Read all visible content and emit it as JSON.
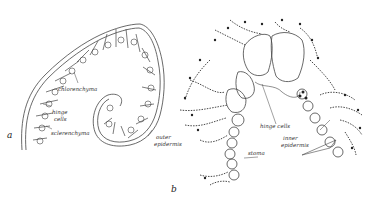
{
  "figure": {
    "panels": [
      {
        "id": "a",
        "letter": "a",
        "labels": {
          "chlorenchyma": "chlorenchyma",
          "hinge_cells_1": "hinge",
          "hinge_cells_2": "cells",
          "sclerenchyma": "sclerenchyma",
          "outer_epidermis_1": "outer",
          "outer_epidermis_2": "epidermis"
        }
      },
      {
        "id": "b",
        "letter": "b",
        "labels": {
          "hinge_cells": "hinge cells",
          "inner_epidermis_1": "inner",
          "inner_epidermis_2": "epidermis",
          "stoma": "stoma"
        }
      }
    ],
    "colors": {
      "ink": "#333333",
      "background": "#ffffff",
      "stipple": "#222222"
    }
  }
}
